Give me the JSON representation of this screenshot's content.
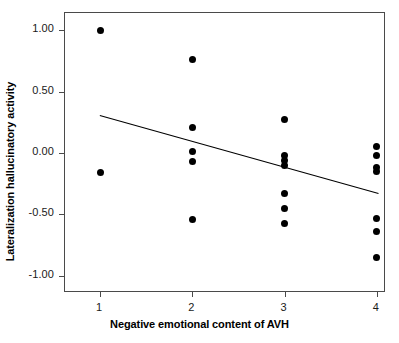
{
  "chart_data": {
    "type": "scatter",
    "title": "",
    "xlabel": "Negative emotional content of AVH",
    "ylabel": "Lateralization hallucinatory activity",
    "xlim": [
      0.62,
      4.1
    ],
    "ylim": [
      -1.14,
      1.14
    ],
    "xticks": [
      1,
      2,
      3,
      4
    ],
    "xticklabels": [
      "1",
      "2",
      "3",
      "4"
    ],
    "yticks": [
      1.0,
      0.5,
      0.0,
      -0.5,
      -1.0
    ],
    "yticklabels": [
      "1.00",
      "0.50",
      "0.00",
      "-0.50",
      "-1.00"
    ],
    "grid": false,
    "legend": null,
    "marker": "filled-circle",
    "marker_color": "#000000",
    "points": [
      {
        "x": 1,
        "y": 1.0
      },
      {
        "x": 1,
        "y": -0.16
      },
      {
        "x": 2,
        "y": 0.76
      },
      {
        "x": 2,
        "y": 0.21
      },
      {
        "x": 2,
        "y": 0.01
      },
      {
        "x": 2,
        "y": -0.07
      },
      {
        "x": 2,
        "y": -0.54
      },
      {
        "x": 3,
        "y": 0.27
      },
      {
        "x": 3,
        "y": -0.02
      },
      {
        "x": 3,
        "y": -0.06
      },
      {
        "x": 3,
        "y": -0.1
      },
      {
        "x": 3,
        "y": -0.33
      },
      {
        "x": 3,
        "y": -0.45
      },
      {
        "x": 3,
        "y": -0.57
      },
      {
        "x": 4,
        "y": 0.05
      },
      {
        "x": 4,
        "y": -0.02
      },
      {
        "x": 4,
        "y": -0.12
      },
      {
        "x": 4,
        "y": -0.15
      },
      {
        "x": 4,
        "y": -0.53
      },
      {
        "x": 4,
        "y": -0.64
      },
      {
        "x": 4,
        "y": -0.85
      }
    ],
    "fit_line": {
      "type": "linear-regression",
      "x_start": 1.0,
      "y_start": 0.3,
      "x_end": 4.04,
      "y_end": -0.34,
      "color": "#000000"
    }
  }
}
